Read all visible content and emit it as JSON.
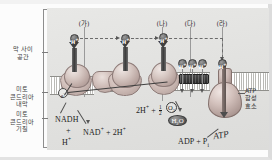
{
  "figure": {
    "title_alt": "미토콘드리아 내막의 전자 전달계와 산화적 인산화",
    "background_color": "#e4e4e2",
    "panel_color": "#e2e2e0"
  },
  "compartments": [
    {
      "id": "intermembrane",
      "line1": "막 사이",
      "line2": "공간"
    },
    {
      "id": "inner-membrane",
      "line1": "미토",
      "line2": "콘드리아",
      "line3": "내막"
    },
    {
      "id": "matrix",
      "line1": "미토",
      "line2": "콘드리아",
      "line3": "기질"
    }
  ],
  "callouts": [
    {
      "id": "ga",
      "label": "(가)"
    },
    {
      "id": "na",
      "label": "(나)"
    },
    {
      "id": "da",
      "label": "(다)"
    },
    {
      "id": "ra",
      "label": "(라)"
    }
  ],
  "ions": {
    "proton_label": "H",
    "proton_charge": "+",
    "electron_label": "e",
    "electron_charge": "−",
    "intermembrane_protons": 3,
    "matrix_proton_row": 4,
    "transporter_proton": 1
  },
  "reactions": {
    "nadh": "NADH",
    "plus": "+",
    "h_plus": "H",
    "h_plus_sup": "+",
    "nad_plus": "NAD",
    "nad_sup": "+",
    "two_h": "2H",
    "two_h_sup": "+",
    "two_h_mid": "2H",
    "two_h_mid_sup": "+",
    "half": "1",
    "half_den": "2",
    "o2": "O",
    "o2_sub": "2",
    "h2o": "H",
    "h2o_sub": "2",
    "h2o_end": "O",
    "adp": "ADP",
    "adp_plus": "+",
    "pi": "P",
    "pi_sub": "i",
    "atp": "ATP"
  },
  "enzyme": {
    "name_line1": "ATP",
    "name_line2": "합성",
    "name_line3": "효소"
  }
}
